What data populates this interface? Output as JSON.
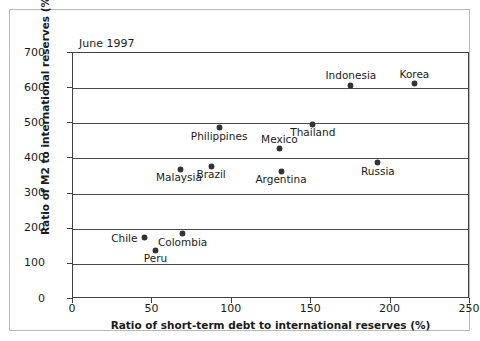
{
  "figure": {
    "annotation": "June 1997"
  },
  "chart_data": {
    "type": "scatter",
    "title": "June 1997",
    "xlabel": "Ratio of short-term debt to international reserves (%)",
    "ylabel": "Ratio of M2 to international reserves (%)",
    "xlim": [
      0,
      250
    ],
    "ylim": [
      0,
      700
    ],
    "xticks": [
      0,
      50,
      100,
      150,
      200,
      250
    ],
    "yticks": [
      0,
      100,
      200,
      300,
      400,
      500,
      600,
      700
    ],
    "xtick_labels": [
      "0",
      "50",
      "100",
      "150",
      "200",
      "250"
    ],
    "ytick_labels": [
      "0",
      "100",
      "200",
      "300",
      "400",
      "500",
      "600",
      "700"
    ],
    "grid": "horizontal",
    "legend": "none",
    "marker_color": "#333333",
    "points": [
      {
        "label": "Indonesia",
        "x": 175,
        "y": 608,
        "label_pos": "above"
      },
      {
        "label": "Korea",
        "x": 215,
        "y": 613,
        "label_pos": "above"
      },
      {
        "label": "Philippines",
        "x": 92,
        "y": 487,
        "label_pos": "below"
      },
      {
        "label": "Thailand",
        "x": 151,
        "y": 497,
        "label_pos": "below"
      },
      {
        "label": "Mexico",
        "x": 130,
        "y": 428,
        "label_pos": "above"
      },
      {
        "label": "Russia",
        "x": 192,
        "y": 388,
        "label_pos": "below"
      },
      {
        "label": "Brazil",
        "x": 87,
        "y": 378,
        "label_pos": "below"
      },
      {
        "label": "Malaysia",
        "x": 68,
        "y": 369,
        "label_pos": "below-left"
      },
      {
        "label": "Argentina",
        "x": 131,
        "y": 363,
        "label_pos": "below"
      },
      {
        "label": "Colombia",
        "x": 69,
        "y": 186,
        "label_pos": "below"
      },
      {
        "label": "Chile",
        "x": 45,
        "y": 174,
        "label_pos": "left"
      },
      {
        "label": "Peru",
        "x": 52,
        "y": 139,
        "label_pos": "below"
      }
    ]
  }
}
